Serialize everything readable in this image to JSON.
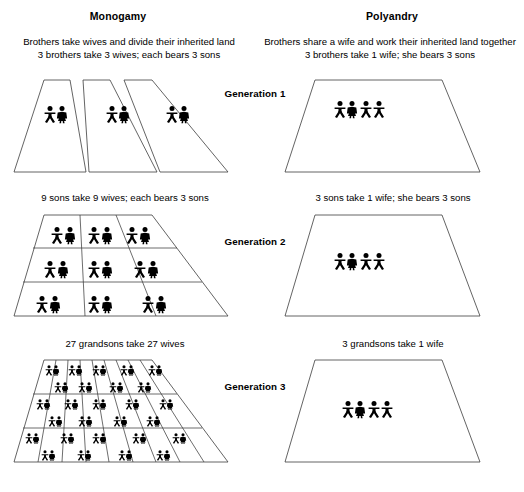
{
  "figure": {
    "type": "diagram"
  },
  "columns": [
    {
      "key": "monogamy",
      "heading": "Monogamy",
      "intro_line1": "Brothers take wives and divide their inherited land",
      "intro_line2": "3 brothers take 3 wives; each bears 3 sons"
    },
    {
      "key": "polyandry",
      "heading": "Polyandry",
      "intro_line1": "Brothers share a wife and work their inherited land together",
      "intro_line2": "3 brothers take 1 wife; she bears 3 sons"
    }
  ],
  "generations": [
    {
      "label": "Generation 1",
      "monogamy": {
        "caption": "",
        "plots": 3,
        "rows": 1,
        "cols": 3,
        "figures_per_plot": "1 male + 1 female"
      },
      "polyandry": {
        "caption": "",
        "plots": 1,
        "figures": "3 males + 1 female"
      }
    },
    {
      "label": "Generation 2",
      "monogamy": {
        "caption": "9 sons take 9 wives; each bears 3 sons",
        "plots": 9,
        "rows": 3,
        "cols": 3,
        "figures_per_plot": "1 male + 1 female"
      },
      "polyandry": {
        "caption": "3 sons take 1 wife; she bears 3 sons",
        "plots": 1,
        "figures": "3 males + 1 female"
      }
    },
    {
      "label": "Generation 3",
      "monogamy": {
        "caption": "27 grandsons take 27 wives",
        "plots": 27,
        "rows": 3,
        "cols": 9,
        "figures_per_plot": "1 male + 1 female"
      },
      "polyandry": {
        "caption": "3 grandsons take 1 wife",
        "plots": 1,
        "figures": "3 males + 1 female"
      }
    }
  ],
  "colors": {
    "line": "#3c3c3c",
    "figure": "#000000",
    "background": "#ffffff"
  }
}
